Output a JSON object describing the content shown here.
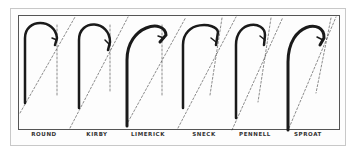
{
  "figure": {
    "hooks": [
      {
        "label": "ROUND",
        "x": 44
      },
      {
        "label": "KIRBY",
        "x": 97
      },
      {
        "label": "LIMERICK",
        "x": 148
      },
      {
        "label": "SNECK",
        "x": 204
      },
      {
        "label": "PENNELL",
        "x": 255
      },
      {
        "label": "SPROAT",
        "x": 308
      }
    ],
    "colors": {
      "ink": "#1a1a1a",
      "border": "#555555",
      "background": "#ffffff"
    }
  }
}
